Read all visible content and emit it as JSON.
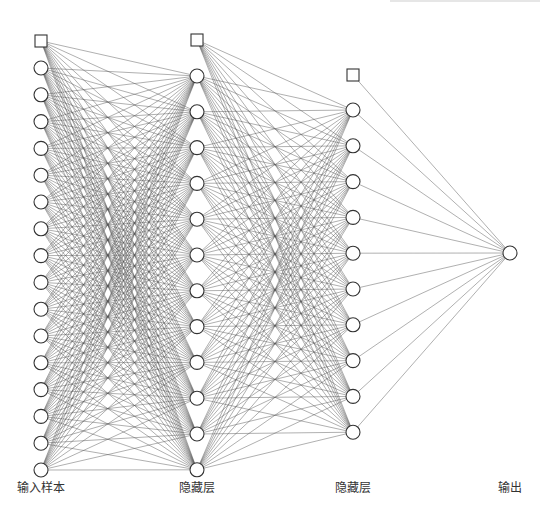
{
  "diagram": {
    "type": "fully-connected neural network",
    "colors": {
      "background": "#ffffff",
      "edge": "#555555",
      "node_stroke": "#333333",
      "node_fill": "#ffffff",
      "label": "#333333"
    },
    "layers": [
      {
        "id": "input",
        "label": "输入样本",
        "x": 41,
        "bias": {
          "y": 41
        },
        "node_count": 16,
        "first_y": 68,
        "spacing": 26.8,
        "label_y": 486
      },
      {
        "id": "hidden1",
        "label": "隐藏层",
        "x": 197,
        "bias": {
          "y": 40
        },
        "node_count": 12,
        "first_y": 76,
        "spacing": 35.8,
        "label_y": 486
      },
      {
        "id": "hidden2",
        "label": "隐藏层",
        "x": 353,
        "bias": {
          "y": 75
        },
        "node_count": 10,
        "first_y": 110,
        "spacing": 35.8,
        "label_y": 486
      },
      {
        "id": "output",
        "label": "输出",
        "x": 510,
        "bias": null,
        "node_count": 1,
        "first_y": 253,
        "spacing": 0,
        "label_y": 486
      }
    ],
    "node_radius": 7,
    "bias_size": 12
  }
}
